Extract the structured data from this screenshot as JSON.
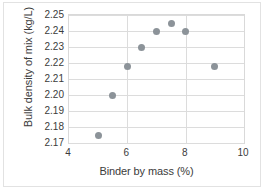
{
  "chart_data": {
    "type": "scatter",
    "title": "",
    "xlabel": "Binder by mass (%)",
    "ylabel": "Bulk density of mix (kg/L)",
    "xlim": [
      4,
      10
    ],
    "ylim": [
      2.17,
      2.25
    ],
    "xticks": [
      "4",
      "6",
      "8",
      "10"
    ],
    "xtick_values": [
      4,
      6,
      8,
      10
    ],
    "yticks": [
      "2.17",
      "2.18",
      "2.19",
      "2.20",
      "2.21",
      "2.22",
      "2.23",
      "2.24",
      "2.25"
    ],
    "ytick_values": [
      2.17,
      2.18,
      2.19,
      2.2,
      2.21,
      2.22,
      2.23,
      2.24,
      2.25
    ],
    "grid": true,
    "legend": false,
    "marker_color": "#8c9399",
    "series": [
      {
        "name": "Bulk density",
        "x": [
          5.0,
          5.5,
          6.0,
          6.5,
          7.0,
          7.5,
          8.0,
          9.0
        ],
        "y": [
          2.175,
          2.2,
          2.218,
          2.23,
          2.24,
          2.245,
          2.24,
          2.218
        ]
      }
    ]
  }
}
